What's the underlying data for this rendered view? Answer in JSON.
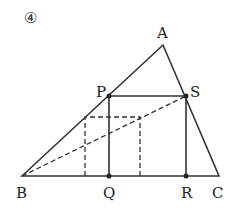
{
  "problem_number": "④",
  "points": {
    "A": {
      "label": "A",
      "x": 163,
      "y": 45
    },
    "B": {
      "label": "B",
      "x": 22,
      "y": 176
    },
    "C": {
      "label": "C",
      "x": 219,
      "y": 176
    },
    "P": {
      "label": "P",
      "x": 109,
      "y": 96
    },
    "Q": {
      "label": "Q",
      "x": 109,
      "y": 176
    },
    "R": {
      "label": "R",
      "x": 186,
      "y": 176
    },
    "S": {
      "label": "S",
      "x": 186,
      "y": 96
    }
  },
  "dashed_rect": {
    "x1": 85,
    "y1": 117,
    "x2": 140,
    "y2": 176
  },
  "colors": {
    "stroke": "#333333",
    "background": "#ffffff"
  }
}
